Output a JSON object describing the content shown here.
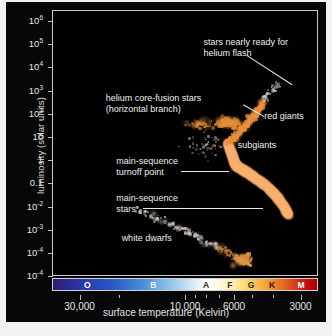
{
  "figure": {
    "background": "#f2f2f2",
    "panel_color": "#070707",
    "plot_background": "#000000",
    "frame_color": "#c9c9c9"
  },
  "chart_data": {
    "type": "scatter",
    "title": "",
    "xlabel": "surface temperature (Kelvin)",
    "ylabel": "luminosity (solar units)",
    "x_scale": "log-reversed",
    "y_scale": "log",
    "xlim": [
      40000,
      2500
    ],
    "ylim": [
      1e-05,
      3000000.0
    ],
    "grid": false,
    "legend": "none",
    "x_ticks": [
      {
        "value": 30000,
        "label": "30,000",
        "major": true
      },
      {
        "value": 20000,
        "label": "",
        "major": false
      },
      {
        "value": 10000,
        "label": "10,000",
        "major": true
      },
      {
        "value": 9000,
        "label": "",
        "major": false
      },
      {
        "value": 8000,
        "label": "",
        "major": false
      },
      {
        "value": 7000,
        "label": "",
        "major": false
      },
      {
        "value": 6000,
        "label": "6000",
        "major": true
      },
      {
        "value": 5000,
        "label": "",
        "major": false
      },
      {
        "value": 4000,
        "label": "",
        "major": false
      },
      {
        "value": 3000,
        "label": "3000",
        "major": true
      }
    ],
    "y_ticks": [
      {
        "value": 1000000,
        "mantissa": "10",
        "exponent": "6"
      },
      {
        "value": 100000,
        "mantissa": "10",
        "exponent": "5"
      },
      {
        "value": 10000,
        "mantissa": "10",
        "exponent": "4"
      },
      {
        "value": 1000,
        "mantissa": "10",
        "exponent": "3"
      },
      {
        "value": 100,
        "mantissa": "10",
        "exponent": "2"
      },
      {
        "value": 10,
        "mantissa": "10",
        "exponent": ""
      },
      {
        "value": 1,
        "mantissa": "1",
        "exponent": ""
      },
      {
        "value": 0.1,
        "mantissa": "0.1",
        "exponent": ""
      },
      {
        "value": 0.01,
        "mantissa": "10",
        "exponent": "-2"
      },
      {
        "value": 0.001,
        "mantissa": "10",
        "exponent": "-3"
      },
      {
        "value": 0.0001,
        "mantissa": "10",
        "exponent": "-4"
      },
      {
        "value": 1e-05,
        "mantissa": "10",
        "exponent": "-4"
      }
    ],
    "spectral_classes": [
      {
        "label": "O",
        "center_pct": 13,
        "color": "#ffffff"
      },
      {
        "label": "B",
        "center_pct": 38,
        "color": "#eaf4ff"
      },
      {
        "label": "A",
        "center_pct": 58,
        "color": "#2a2a2a"
      },
      {
        "label": "F",
        "center_pct": 67,
        "color": "#2a2a2a"
      },
      {
        "label": "G",
        "center_pct": 75,
        "color": "#2a2a2a"
      },
      {
        "label": "K",
        "center_pct": 83,
        "color": "#3a1500"
      },
      {
        "label": "M",
        "center_pct": 94,
        "color": "#ffffff"
      }
    ],
    "spectral_bar_gradient": [
      "#2a1f6e",
      "#2b2f9c",
      "#2a57c6",
      "#4a8ed8",
      "#8cc4ea",
      "#cfe6f5",
      "#ffffff",
      "#fff6d2",
      "#ffdf7a",
      "#f7a93a",
      "#e2621f",
      "#c41010",
      "#a40000"
    ],
    "annotations": [
      {
        "id": "helium-flash",
        "text": "stars nearly ready for\nhelium flash",
        "x_pct": 57,
        "y_pct": 10,
        "align": "left"
      },
      {
        "id": "horizontal-branch",
        "text": "helium core-fusion stars\n(horizontal branch)",
        "x_pct": 20,
        "y_pct": 31,
        "align": "left"
      },
      {
        "id": "red-giants",
        "text": "red giants",
        "x_pct": 80,
        "y_pct": 38,
        "align": "left"
      },
      {
        "id": "subgiants",
        "text": "subgiants",
        "x_pct": 70,
        "y_pct": 49,
        "align": "left"
      },
      {
        "id": "ms-turnoff",
        "text": "main-sequence\nturnoff point",
        "x_pct": 24,
        "y_pct": 55,
        "align": "left"
      },
      {
        "id": "ms-stars",
        "text": "main-sequence\nstars",
        "x_pct": 24,
        "y_pct": 69,
        "align": "left"
      },
      {
        "id": "white-dwarfs",
        "text": "white dwarfs",
        "x_pct": 26,
        "y_pct": 84,
        "align": "left"
      }
    ],
    "populations": [
      {
        "name": "main-sequence",
        "color": "#f0a35a",
        "count": 900,
        "description": "dense orange band from turnoff at ~6000K down to ~3500K"
      },
      {
        "name": "red-giant-branch",
        "color": "#e8913f",
        "count": 220,
        "description": "rising branch toward cool luminous stars"
      },
      {
        "name": "horizontal-branch",
        "color": "#e09038",
        "count": 120,
        "description": "clump near luminosity 40-60"
      },
      {
        "name": "white-dwarfs",
        "color": "#d8d0c4",
        "count": 150,
        "description": "faint diagonal sequence below 10^-2"
      },
      {
        "name": "helium-flash-tip",
        "color": "#cfcfcf",
        "count": 30,
        "description": "sparse points toward 10^3 at low temperature"
      }
    ]
  }
}
